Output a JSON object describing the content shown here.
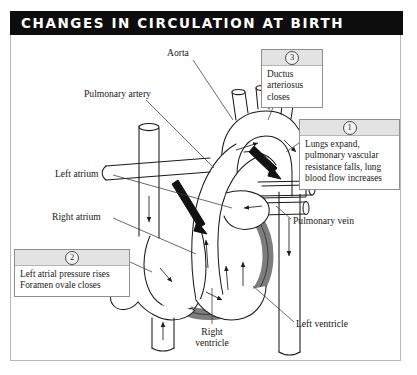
{
  "title": "CHANGES IN CIRCULATION AT BIRTH",
  "callouts": [
    {
      "number": "1",
      "text": "Lungs expand, pulmonary vascular resistance falls, lung blood flow increases"
    },
    {
      "number": "2",
      "text": "Left atrial pressure rises Foramen ovale closes"
    },
    {
      "number": "3",
      "text": "Ductus arteriosus closes"
    }
  ],
  "labels": {
    "aorta": "Aorta",
    "pulmonary_artery": "Pulmonary artery",
    "left_atrium": "Left atrium",
    "right_atrium": "Right atrium",
    "pulmonary_vein": "Pulmonary vein",
    "left_ventricle": "Left ventricle",
    "right_ventricle": "Right ventricle"
  },
  "colors": {
    "title_bar": "#0d0d0d",
    "title_text": "#ffffff",
    "frame_border": "#b9b9b9",
    "callout_header": "#e3e3e3",
    "vessel_outline": "#1a1a1a",
    "ventricle_wall": "#7d7d7d",
    "arrow_fill": "#111111"
  }
}
